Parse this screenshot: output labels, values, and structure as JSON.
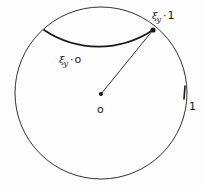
{
  "figure": {
    "type": "geometry-diagram",
    "background_color": "#fdfdfd",
    "stroke_color": "#1a1a1a"
  },
  "circle": {
    "name": "unit-circle",
    "center_x": 101,
    "center_y": 93,
    "radius": 86,
    "stroke_width": 0.9
  },
  "center_point": {
    "name": "center-point",
    "x": 101,
    "y": 94,
    "radius": 2.1,
    "label": "o"
  },
  "boundary_point": {
    "name": "xi-one-point",
    "x": 153,
    "y": 30,
    "radius": 2.6
  },
  "radius_segment": {
    "name": "radius-segment",
    "x1": 101,
    "y1": 94,
    "x2": 153,
    "y2": 30,
    "stroke_width": 0.9
  },
  "arc": {
    "name": "geodesic-arc",
    "start_x": 44,
    "start_y": 30,
    "end_x": 153,
    "end_y": 30,
    "sweep_radius": 98,
    "stroke_width": 1.7
  },
  "boundary_tick": {
    "name": "boundary-tick",
    "x1": 185,
    "y1": 86,
    "x2": 184,
    "y2": 99,
    "stroke_width": 1.6
  },
  "labels": {
    "xi_one": {
      "symbol": "ξ",
      "subscript": "y",
      "operator": "·",
      "value": "1"
    },
    "xi_zero": {
      "symbol": "ξ",
      "subscript": "y",
      "operator": "·",
      "value": "o"
    },
    "center": "o",
    "unit": "1"
  }
}
